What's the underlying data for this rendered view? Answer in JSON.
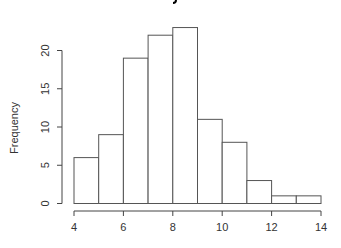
{
  "chart_data": {
    "type": "bar",
    "subtype": "histogram",
    "xlabel": "",
    "ylabel": "Frequency",
    "bin_edges": [
      4,
      5,
      6,
      7,
      8,
      9,
      10,
      11,
      12,
      13,
      14
    ],
    "categories": [
      "4-5",
      "5-6",
      "6-7",
      "7-8",
      "8-9",
      "9-10",
      "10-11",
      "11-12",
      "12-13",
      "13-14"
    ],
    "values": [
      6,
      9,
      19,
      22,
      23,
      11,
      8,
      3,
      1,
      1
    ],
    "xlim": [
      4,
      14
    ],
    "ylim": [
      0,
      23
    ],
    "x_ticks": [
      4,
      6,
      8,
      10,
      12,
      14
    ],
    "y_ticks": [
      0,
      5,
      10,
      15,
      20
    ],
    "grid": false,
    "legend": null,
    "bar_fill": "#ffffff",
    "bar_stroke": "#555555"
  },
  "labels": {
    "ylabel": "Frequency",
    "x_ticks": [
      "4",
      "6",
      "8",
      "10",
      "12",
      "14"
    ],
    "y_ticks": [
      "0",
      "5",
      "10",
      "15",
      "20"
    ]
  }
}
